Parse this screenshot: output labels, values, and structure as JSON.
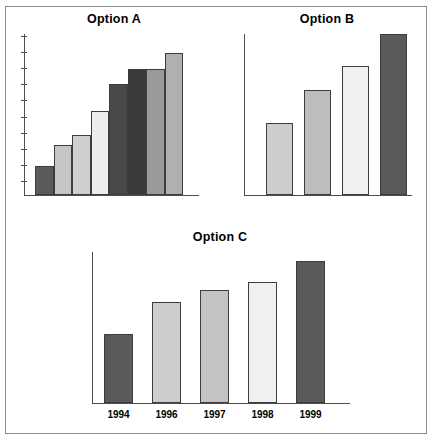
{
  "figure": {
    "background": "#ffffff",
    "frame_color": "#8c8c8c",
    "axis_color": "#4d4d4d"
  },
  "chart_data": [
    {
      "type": "bar",
      "title": "Option A",
      "xlabel": "",
      "ylabel": "",
      "categories": [
        "1",
        "2",
        "3",
        "4",
        "5",
        "6",
        "7",
        "8"
      ],
      "values": [
        18,
        31,
        37,
        52,
        69,
        78,
        78,
        88
      ],
      "ylim": [
        0,
        100
      ],
      "grid": false,
      "legend": "none",
      "axis_ticks_y": 10,
      "bar_colors": [
        "#5a5a5a",
        "#c6c6c6",
        "#cfcfcf",
        "#ececec",
        "#494949",
        "#3a3a3a",
        "#9a9a9a",
        "#b0b0b0"
      ]
    },
    {
      "type": "bar",
      "title": "Option B",
      "xlabel": "",
      "ylabel": "",
      "categories": [
        "1",
        "2",
        "3",
        "4"
      ],
      "values": [
        45,
        65,
        80,
        100
      ],
      "ylim": [
        0,
        100
      ],
      "grid": false,
      "legend": "none",
      "axis_ticks_y": 0,
      "bar_colors": [
        "#cdcdcd",
        "#bdbdbd",
        "#f0f0f0",
        "#5a5a5a"
      ]
    },
    {
      "type": "bar",
      "title": "Option C",
      "xlabel": "",
      "ylabel": "",
      "categories": [
        "1994",
        "1996",
        "1997",
        "1998",
        "1999"
      ],
      "values": [
        46,
        67,
        75,
        80,
        94
      ],
      "ylim": [
        0,
        100
      ],
      "grid": false,
      "legend": "none",
      "axis_ticks_y": 0,
      "bar_colors": [
        "#5a5a5a",
        "#cdcdcd",
        "#c3c3c3",
        "#f0f0f0",
        "#5a5a5a"
      ]
    }
  ]
}
